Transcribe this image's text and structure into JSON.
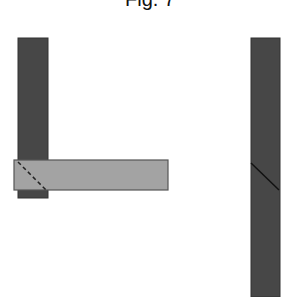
{
  "figure": {
    "title": "Fig. 7",
    "colors": {
      "dark_member": "#474747",
      "light_member": "#a3a3a3",
      "edge": "#333333",
      "joint_line": "#222222"
    },
    "left_assembly": {
      "description": "L-shaped corner joint: dark vertical member meeting light horizontal member with dashed mitre line",
      "vertical_member": {
        "x": 18,
        "y": 38,
        "w": 30,
        "h": 160
      },
      "horizontal_member": {
        "x": 14,
        "y": 160,
        "w": 154,
        "h": 30
      },
      "mitre_line": {
        "style": "dashed",
        "x1": 18,
        "y1": 162,
        "x2": 46,
        "y2": 190
      }
    },
    "right_assembly": {
      "description": "Straight dark member with solid diagonal joint line",
      "member": {
        "x": 251,
        "y": 38,
        "w": 29,
        "h": 259
      },
      "joint_line": {
        "style": "solid",
        "x1": 251,
        "y1": 163,
        "x2": 279,
        "y2": 190
      }
    }
  }
}
